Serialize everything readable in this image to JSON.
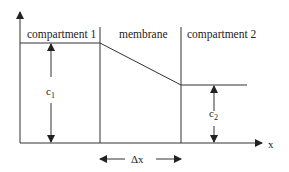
{
  "diagram": {
    "labels": {
      "compartment1": "compartment 1",
      "membrane": "membrane",
      "compartment2": "compartment 2",
      "c1": "c",
      "c1_sub": "1",
      "c2": "c",
      "c2_sub": "2",
      "delta_x": "Δx",
      "x_axis": "x"
    },
    "colors": {
      "line": "#333333",
      "background": "#ffffff"
    }
  }
}
